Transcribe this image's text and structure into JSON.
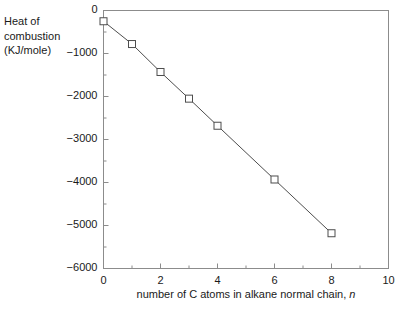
{
  "chart_data": {
    "type": "line",
    "title": "",
    "xlabel": "number of C atoms in alkane normal chain, n",
    "xlabel_plain": "number of C atoms in alkane normal chain,",
    "xlabel_italic": "n",
    "ylabel_lines": [
      "Heat of",
      "combustion",
      "(KJ/mole)"
    ],
    "ylabel": "Heat of combustion (KJ/mole)",
    "x": [
      0,
      1,
      2,
      3,
      4,
      6,
      8
    ],
    "values": [
      -250,
      -780,
      -1430,
      -2050,
      -2680,
      -3930,
      -5180
    ],
    "series": [
      {
        "name": "heat of combustion",
        "x": [
          0,
          1,
          2,
          3,
          4,
          6,
          8
        ],
        "values": [
          -250,
          -780,
          -1430,
          -2050,
          -2680,
          -3930,
          -5180
        ]
      }
    ],
    "xlim": [
      0,
      10
    ],
    "ylim": [
      -6000,
      0
    ],
    "xticks": [
      0,
      2,
      4,
      6,
      8,
      10
    ],
    "xtick_labels": [
      "0",
      "2",
      "4",
      "6",
      "8",
      "10"
    ],
    "x_minor_ticks": [
      1,
      3,
      5,
      7,
      9
    ],
    "yticks": [
      0,
      -1000,
      -2000,
      -3000,
      -4000,
      -5000,
      -6000
    ],
    "ytick_labels": [
      "0",
      "−1000",
      "−2000",
      "−3000",
      "−4000",
      "−5000",
      "−6000"
    ],
    "y_minor_ticks": [
      -500,
      -1500,
      -2500,
      -3500,
      -4500,
      -5500
    ],
    "grid": false,
    "legend": false,
    "legend_position": "none",
    "marker": "open-square",
    "line_color": "#4d4d4d",
    "marker_edge_color": "#4d4d4d",
    "marker_face_color": "#ffffff",
    "axis_color": "#8c8c8c",
    "text_color": "#1a1a1a",
    "background": "#ffffff"
  }
}
